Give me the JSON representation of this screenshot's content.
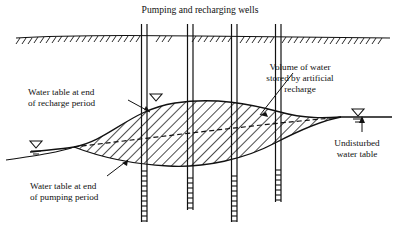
{
  "figure": {
    "title": "Pumping and recharging wells",
    "background_color": "#ffffff",
    "ink_color": "#111111"
  },
  "labels": {
    "recharge_line1": "Water table at end",
    "recharge_line2": "of recharge period",
    "pumping_line1": "Water table at end",
    "pumping_line2": "of pumping period",
    "volume_line1": "Volume of water",
    "volume_line2": "stored by artificial",
    "volume_line3": "recharge",
    "undisturbed_line1": "Undisturbed",
    "undisturbed_line2": "water table"
  },
  "elements": {
    "ground_surface": "ground-surface-line",
    "hatched_region": "stored-water-volume",
    "undisturbed_water_table": "undisturbed-water-table-line",
    "recharge_water_table": "recharge-period-water-table-curve",
    "pumping_water_table": "pumping-period-water-table-curve"
  },
  "wells": [
    {
      "name": "well-1",
      "x": 144
    },
    {
      "name": "well-2",
      "x": 190
    },
    {
      "name": "well-3",
      "x": 234
    },
    {
      "name": "well-4",
      "x": 278
    }
  ],
  "water_level_symbols": [
    {
      "name": "water-level-symbol-left",
      "x": 36,
      "y": 146
    },
    {
      "name": "water-level-symbol-well",
      "x": 156,
      "y": 99
    },
    {
      "name": "water-level-symbol-right",
      "x": 358,
      "y": 114
    }
  ],
  "icons": {
    "water_level_triangle": "water-level-triangle-icon",
    "pointer_arrow": "pointer-arrow-icon"
  }
}
